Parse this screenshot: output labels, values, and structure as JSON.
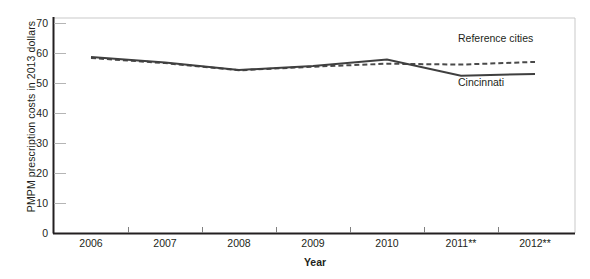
{
  "chart_data": {
    "type": "line",
    "title": "",
    "xlabel": "Year",
    "ylabel": "PMPM prescription costs in 2013 dollars",
    "categories": [
      "2006",
      "2007",
      "2008",
      "2009",
      "2010",
      "2011**",
      "2012**"
    ],
    "ylim": [
      0,
      70
    ],
    "yticks": [
      0,
      10,
      20,
      30,
      40,
      50,
      60,
      70
    ],
    "ytick_labels": [
      "0",
      "10",
      "20",
      "30",
      "40",
      "50",
      "60",
      "70"
    ],
    "grid": false,
    "legend_position": "inline-annotations",
    "series": [
      {
        "name": "Cincinnati",
        "style": "solid",
        "color": "#3f3f3f",
        "values": [
          58.8,
          57.0,
          54.5,
          55.8,
          58.0,
          52.6,
          53.2
        ]
      },
      {
        "name": "Reference cities",
        "style": "dashed",
        "color": "#4a4a4a",
        "values": [
          58.5,
          56.8,
          54.4,
          55.6,
          56.6,
          56.3,
          57.2
        ]
      }
    ],
    "annotations": [
      {
        "text": "Reference cities",
        "x": 2011,
        "y": 61.5
      },
      {
        "text": "Cincinnati",
        "x": 2011,
        "y": 49.5
      }
    ]
  },
  "axes": {
    "y_title": "PMPM prescription costs in 2013 dollars",
    "x_title": "Year"
  },
  "labels": {
    "reference_cities": "Reference cities",
    "cincinnati": "Cincinnati"
  },
  "colors": {
    "axis": "#231f20",
    "frame": "#c9c9c9",
    "series_cincinnati": "#3f3f3f",
    "series_reference": "#4a4a4a",
    "text": "#231f20",
    "background": "#ffffff"
  }
}
